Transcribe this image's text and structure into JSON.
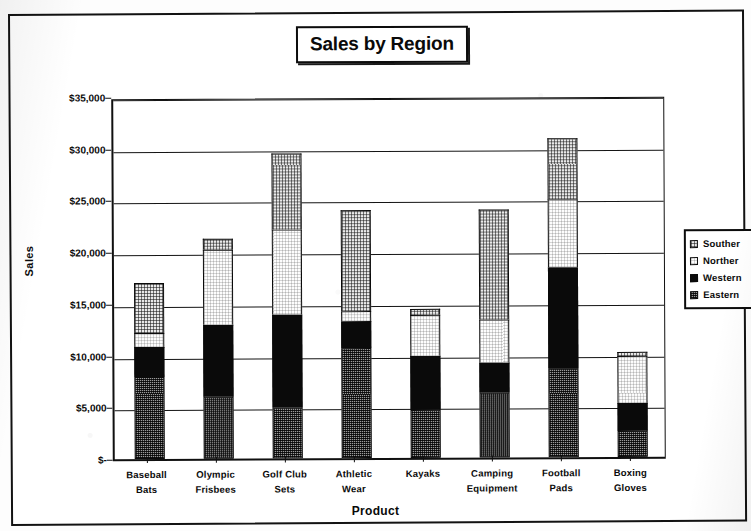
{
  "chart_data": {
    "type": "bar",
    "subtype": "stacked-bar",
    "title": "Sales by Region",
    "xlabel": "Product",
    "ylabel": "Sales",
    "ylim": [
      0,
      35000
    ],
    "ytick_labels": [
      "$-",
      "$5,000",
      "$10,000",
      "$15,000",
      "$20,000",
      "$25,000",
      "$30,000",
      "$35,000"
    ],
    "ytick_values": [
      0,
      5000,
      10000,
      15000,
      20000,
      25000,
      30000,
      35000
    ],
    "grid": true,
    "legend_position": "right",
    "categories": [
      "Baseball Bats",
      "Olympic Frisbees",
      "Golf Club Sets",
      "Athletic Wear",
      "Kayaks",
      "Camping Equipment",
      "Football Pads",
      "Boxing Gloves"
    ],
    "category_lines": [
      [
        "Baseball",
        "Bats"
      ],
      [
        "Olympic",
        "Frisbees"
      ],
      [
        "Golf Club",
        "Sets"
      ],
      [
        "Athletic",
        "Wear"
      ],
      [
        "Kayaks",
        ""
      ],
      [
        "Camping",
        "Equipment"
      ],
      [
        "Football",
        "Pads"
      ],
      [
        "Boxing",
        "Gloves"
      ]
    ],
    "series": [
      {
        "name": "Eastern",
        "fill": "eastern",
        "values": [
          7900,
          6000,
          4900,
          10600,
          4600,
          6300,
          8600,
          2500
        ]
      },
      {
        "name": "Western",
        "fill": "western",
        "values": [
          2900,
          7000,
          9000,
          2600,
          5300,
          2900,
          9800,
          2700
        ]
      },
      {
        "name": "Northern",
        "fill": "northern",
        "values": [
          1400,
          7200,
          8200,
          1000,
          3900,
          4100,
          6500,
          4600
        ]
      },
      {
        "name": "Southern",
        "fill": "southern",
        "values": [
          4800,
          1100,
          7400,
          9800,
          600,
          10700,
          5900,
          400
        ]
      }
    ],
    "stack_order_bottom_to_top": [
      "Eastern",
      "Western",
      "Northern",
      "Southern"
    ],
    "totals": [
      17000,
      21300,
      29500,
      24000,
      14400,
      24000,
      30800,
      10200
    ]
  },
  "legend": {
    "items": [
      {
        "label": "Souther",
        "full": "Southern",
        "swatch": "southern"
      },
      {
        "label": "Norther",
        "full": "Northern",
        "swatch": "northern"
      },
      {
        "label": "Western",
        "full": "Western",
        "swatch": "western"
      },
      {
        "label": "Eastern",
        "full": "Eastern",
        "swatch": "eastern"
      }
    ]
  },
  "colors": {
    "axis": "#101010",
    "grid": "#151515",
    "text": "#0b0b0b",
    "southern": "#e9e9e9",
    "northern": "#fdfdfd",
    "western": "#0a0a0a",
    "eastern": "#9a9a9a",
    "background": "#ffffff"
  }
}
